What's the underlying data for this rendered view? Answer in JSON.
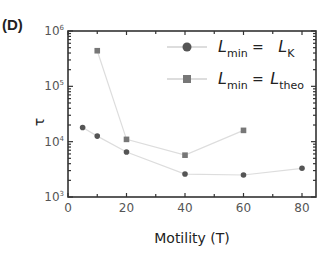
{
  "chart_data": {
    "type": "scatter",
    "panel_label": "(D)",
    "title": "",
    "xlabel": "Motility (T)",
    "ylabel": "τ",
    "xscale": "linear",
    "yscale": "log",
    "xlim": [
      0,
      85
    ],
    "ylim": [
      1000,
      1000000
    ],
    "xticks": [
      0,
      20,
      40,
      60,
      80
    ],
    "xtick_labels": [
      "0",
      "20",
      "40",
      "60",
      "80"
    ],
    "yticks": [
      1000,
      10000,
      100000,
      1000000
    ],
    "ytick_labels": [
      {
        "base": "10",
        "exp": "3"
      },
      {
        "base": "10",
        "exp": "4"
      },
      {
        "base": "10",
        "exp": "5"
      },
      {
        "base": "10",
        "exp": "6"
      }
    ],
    "grid": false,
    "legend_position": "top-right",
    "series": [
      {
        "name": "L_min = L_K",
        "legend": {
          "lhs": "L",
          "lhs_sub": "min",
          "eq": "=",
          "rhs": "L",
          "rhs_sub": "K"
        },
        "marker": "circle",
        "color": "#555555",
        "line_color": "#dddddd",
        "x": [
          5,
          10,
          20,
          40,
          60,
          80
        ],
        "y": [
          18000,
          12600,
          6500,
          2600,
          2500,
          3300
        ]
      },
      {
        "name": "L_min = L_theo",
        "legend": {
          "lhs": "L",
          "lhs_sub": "min",
          "eq": "=",
          "rhs": "L",
          "rhs_sub": "theo"
        },
        "marker": "square",
        "color": "#777777",
        "line_color": "#dddddd",
        "x": [
          10,
          20,
          40,
          60
        ],
        "y": [
          440000,
          11000,
          5700,
          16000
        ]
      }
    ]
  }
}
